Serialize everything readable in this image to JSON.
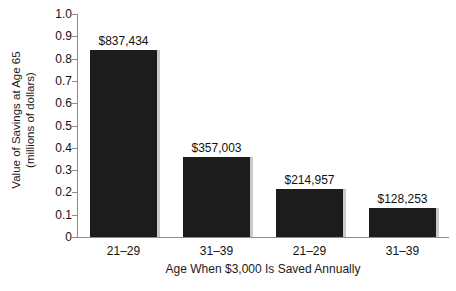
{
  "chart_data": {
    "type": "bar",
    "title": "",
    "categories": [
      "21–29",
      "31–39",
      "21–29",
      "31–39"
    ],
    "values": [
      0.837434,
      0.357003,
      0.214957,
      0.128253
    ],
    "data_labels": [
      "$837,434",
      "$357,003",
      "$214,957",
      "$128,253"
    ],
    "xlabel": "Age When $3,000 Is Saved Annually",
    "ylabel_line1": "Value of Savings at Age 65",
    "ylabel_line2": "(millions of dollars)",
    "ylim": [
      0,
      1.0
    ],
    "ytick_labels": [
      "0",
      "0.1",
      "0.2",
      "0.3",
      "0.4",
      "0.5",
      "0.6",
      "0.7",
      "0.8",
      "0.9",
      "1.0"
    ],
    "ytick_values": [
      0,
      0.1,
      0.2,
      0.3,
      0.4,
      0.5,
      0.6,
      0.7,
      0.8,
      0.9,
      1.0
    ],
    "grid": false,
    "legend": false,
    "bar_color": "#1c1c1c",
    "shadow_color": "#c9c9c9",
    "axis_color": "#8d8d8d",
    "text_color": "#111111",
    "background": "#ffffff"
  }
}
